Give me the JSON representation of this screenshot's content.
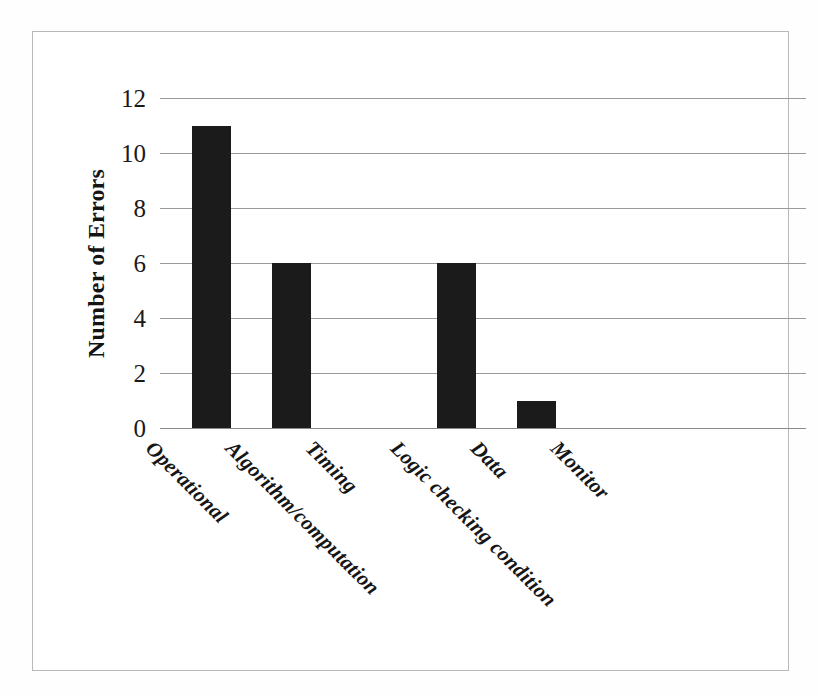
{
  "figure": {
    "background_color": "#fefefe",
    "frame_color": "#b9b9b9",
    "bar_color": "#1b1b1b",
    "gridline_color": "#9a9a9a"
  },
  "chart_data": {
    "type": "bar",
    "title": "",
    "xlabel": "",
    "ylabel": "Number of Errors",
    "categories": [
      "Operational",
      "Algorithm/computation",
      "Timing",
      "Logic checking condition",
      "Data",
      "Monitor"
    ],
    "values": [
      11,
      6,
      0,
      6,
      1,
      0
    ],
    "ylim": [
      0,
      12
    ],
    "ytick_labels": [
      "0",
      "2",
      "4",
      "6",
      "8",
      "10",
      "12"
    ],
    "ytick_values": [
      0,
      2,
      4,
      6,
      8,
      10,
      12
    ],
    "grid": true,
    "legend": null,
    "annotations": []
  }
}
